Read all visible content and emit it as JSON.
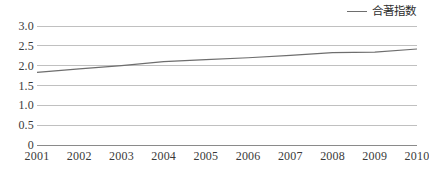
{
  "legend": {
    "marker": "line-marker-icon",
    "label": "合著指数",
    "position": "top-right"
  },
  "axes": {
    "y_ticks": [
      "0",
      "0.5",
      "1.0",
      "1.5",
      "2.0",
      "2.5",
      "3.0"
    ],
    "x_ticks": [
      "2001",
      "2002",
      "2003",
      "2004",
      "2005",
      "2006",
      "2007",
      "2008",
      "2009",
      "2010"
    ]
  },
  "colors": {
    "line": "#6e6e6e",
    "gridline": "#b9b9b9",
    "axis": "#8a8a8a",
    "text": "#3a3a3a"
  },
  "chart_data": {
    "type": "line",
    "title": "",
    "xlabel": "",
    "ylabel": "",
    "x": [
      "2001",
      "2002",
      "2003",
      "2004",
      "2005",
      "2006",
      "2007",
      "2008",
      "2009",
      "2010"
    ],
    "series": [
      {
        "name": "合著指数",
        "values": [
          1.83,
          1.92,
          2.0,
          2.1,
          2.15,
          2.2,
          2.26,
          2.33,
          2.34,
          2.42
        ]
      }
    ],
    "ylim": [
      0,
      3.0
    ],
    "yticks": [
      0,
      0.5,
      1.0,
      1.5,
      2.0,
      2.5,
      3.0
    ],
    "grid": true,
    "legend_position": "top-right"
  }
}
